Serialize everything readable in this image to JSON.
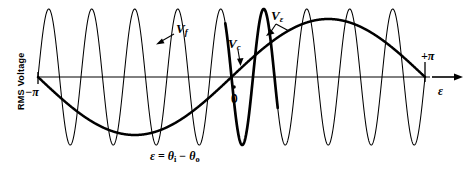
{
  "figure": {
    "background_color": "#ffffff",
    "ink_color": "#000000",
    "axis_label_y": "RMS Voltage",
    "axis_label_x": "ε",
    "caption": "ε = θi − θo",
    "caption_parts": {
      "lhs": "ε",
      "equals": "=",
      "theta_i": "θ",
      "sub_i": "i",
      "minus": "−",
      "theta_o": "θ",
      "sub_o": "o"
    }
  },
  "axis": {
    "x_min_label": "−π",
    "x_max_label": "+π",
    "origin_label": "0",
    "x_range": [
      -3.14159,
      3.14159
    ],
    "baseline_y_px": 77,
    "left_px": 38,
    "right_px": 425,
    "grid": false,
    "y_ticks": [],
    "x_ticks": [
      "−π",
      "0",
      "+π"
    ]
  },
  "curves": {
    "vf": {
      "name": "V_f",
      "label": "V",
      "label_sub": "f",
      "description": "high-frequency carrier sine, thin stroke",
      "cycles": 9,
      "amplitude": 68,
      "stroke_width": 1,
      "phase_deg": 0
    },
    "vc": {
      "name": "V_c",
      "label": "V",
      "label_sub": "c",
      "description": "single emphasized cycle of carrier at origin, thick stroke",
      "center_x_px": 233,
      "amplitude": 68,
      "stroke_width": 2.6
    },
    "veps": {
      "name": "V_epsilon",
      "label": "V",
      "label_sub": "ε",
      "description": "low-frequency envelope sine over -pi..+pi, thick stroke",
      "cycles": 1,
      "amplitude": 58,
      "stroke_width": 2.4,
      "phase_deg": 180
    }
  },
  "chart_data": {
    "type": "line",
    "title": "",
    "xlabel": "ε",
    "ylabel": "RMS Voltage",
    "xlim": [
      -3.14159,
      3.14159
    ],
    "ylim": [
      -1.05,
      1.05
    ],
    "grid": false,
    "legend": "inline-annotations",
    "annotations": [
      {
        "text": "V_f",
        "x": -0.35,
        "y": 0.8,
        "leader": true
      },
      {
        "text": "V_c",
        "x": 0.42,
        "y": 0.58,
        "leader": true
      },
      {
        "text": "V_ε",
        "x": 1.05,
        "y": 0.95,
        "leader": true
      },
      {
        "text": "0",
        "x": 0.0,
        "y": -0.25,
        "leader": false
      },
      {
        "text": "−π",
        "x": -3.14159,
        "y": -0.15,
        "leader": false
      },
      {
        "text": "+π",
        "x": 3.14159,
        "y": 0.4,
        "leader": false
      }
    ],
    "series": [
      {
        "name": "V_f",
        "formula": "sin(9 * ε)",
        "amplitude": 1.0,
        "frequency_cycles_over_range": 9,
        "style": "thin"
      },
      {
        "name": "V_c",
        "formula": "sin(9 * ε) over one cycle centered at ε = 0",
        "amplitude": 1.0,
        "style": "thick-highlight"
      },
      {
        "name": "V_ε",
        "formula": "-sin(ε)",
        "amplitude": 0.85,
        "frequency_cycles_over_range": 1,
        "style": "thick"
      }
    ]
  }
}
